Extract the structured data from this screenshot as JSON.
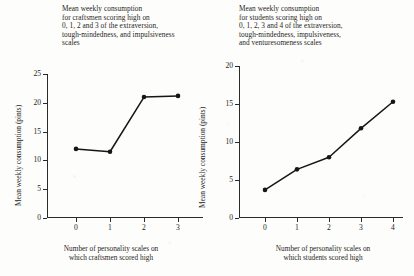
{
  "chart_data": [
    {
      "type": "line",
      "title": "Mean weekly consumption\nfor craftsmen scoring high on\n0, 1, 2 and 3 of the extraversion,\ntough-mindedness, and impulsiveness\nscales",
      "xlabel": "Number of personality scales on\nwhich craftsmen scored high",
      "ylabel": "Mean weekly consumption (pints)",
      "categories": [
        "0",
        "1",
        "2",
        "3"
      ],
      "x": [
        0,
        1,
        2,
        3
      ],
      "values": [
        12.0,
        11.5,
        21.0,
        21.2
      ],
      "xticks": [
        "0",
        "1",
        "2",
        "3"
      ],
      "yticks": [
        "0",
        "5",
        "10",
        "15",
        "20",
        "25"
      ],
      "xlim": [
        -0.25,
        3.35
      ],
      "ylim": [
        0,
        25
      ],
      "grid": false,
      "legend": "none",
      "marker": "filled-circle"
    },
    {
      "type": "line",
      "title": "Mean weekly consumption\nfor students scoring high on\n0, 1, 2, 3 and 4 of the extraversion,\ntough-mindedness, impulsiveness,\nand venturesomeness scales",
      "xlabel": "Number of personality scales on\nwhich students scored high",
      "ylabel": "Mean weekly consumption (pints)",
      "categories": [
        "0",
        "1",
        "2",
        "3",
        "4"
      ],
      "x": [
        0,
        1,
        2,
        3,
        4
      ],
      "values": [
        3.7,
        6.4,
        8.0,
        11.8,
        15.3
      ],
      "xticks": [
        "0",
        "1",
        "2",
        "3",
        "4"
      ],
      "yticks": [
        "0",
        "5",
        "10",
        "15",
        "20"
      ],
      "xlim": [
        -0.35,
        4.3
      ],
      "ylim": [
        0,
        20
      ],
      "grid": false,
      "legend": "none",
      "marker": "filled-circle"
    }
  ]
}
